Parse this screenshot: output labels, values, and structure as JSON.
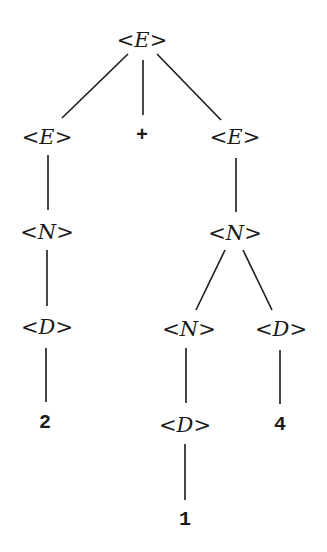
{
  "diagram": {
    "type": "parse-tree",
    "nodes": [
      {
        "id": "E0",
        "kind": "nonterminal",
        "label": "E",
        "x": 142,
        "y": 40
      },
      {
        "id": "E1",
        "kind": "nonterminal",
        "label": "E",
        "x": 47,
        "y": 137
      },
      {
        "id": "plus",
        "kind": "terminal",
        "label": "+",
        "x": 142,
        "y": 136
      },
      {
        "id": "E2",
        "kind": "nonterminal",
        "label": "E",
        "x": 235,
        "y": 137
      },
      {
        "id": "N1",
        "kind": "nonterminal",
        "label": "N",
        "x": 47,
        "y": 232
      },
      {
        "id": "N2",
        "kind": "nonterminal",
        "label": "N",
        "x": 235,
        "y": 233
      },
      {
        "id": "D1",
        "kind": "nonterminal",
        "label": "D",
        "x": 47,
        "y": 327
      },
      {
        "id": "N3",
        "kind": "nonterminal",
        "label": "N",
        "x": 189,
        "y": 329
      },
      {
        "id": "D3",
        "kind": "nonterminal",
        "label": "D",
        "x": 281,
        "y": 329
      },
      {
        "id": "t2",
        "kind": "terminal",
        "label": "2",
        "x": 45,
        "y": 423
      },
      {
        "id": "D2",
        "kind": "nonterminal",
        "label": "D",
        "x": 185,
        "y": 425
      },
      {
        "id": "t4",
        "kind": "terminal",
        "label": "4",
        "x": 280,
        "y": 425
      },
      {
        "id": "t1",
        "kind": "terminal",
        "label": "1",
        "x": 185,
        "y": 520
      }
    ],
    "edges": [
      {
        "from": "E0",
        "to": "E1",
        "x1": 128,
        "y1": 54,
        "x2": 62,
        "y2": 118
      },
      {
        "from": "E0",
        "to": "plus",
        "x1": 143,
        "y1": 60,
        "x2": 143,
        "y2": 115
      },
      {
        "from": "E0",
        "to": "E2",
        "x1": 157,
        "y1": 54,
        "x2": 221,
        "y2": 120
      },
      {
        "from": "E1",
        "to": "N1",
        "x1": 48,
        "y1": 155,
        "x2": 48,
        "y2": 210
      },
      {
        "from": "E2",
        "to": "N2",
        "x1": 236,
        "y1": 158,
        "x2": 236,
        "y2": 212
      },
      {
        "from": "N1",
        "to": "D1",
        "x1": 47,
        "y1": 250,
        "x2": 47,
        "y2": 306
      },
      {
        "from": "N2",
        "to": "N3",
        "x1": 225,
        "y1": 250,
        "x2": 196,
        "y2": 310
      },
      {
        "from": "N2",
        "to": "D3",
        "x1": 243,
        "y1": 250,
        "x2": 272,
        "y2": 310
      },
      {
        "from": "D1",
        "to": "t2",
        "x1": 46,
        "y1": 348,
        "x2": 46,
        "y2": 402
      },
      {
        "from": "N3",
        "to": "D2",
        "x1": 186,
        "y1": 348,
        "x2": 186,
        "y2": 403
      },
      {
        "from": "D3",
        "to": "t4",
        "x1": 280,
        "y1": 350,
        "x2": 280,
        "y2": 404
      },
      {
        "from": "D2",
        "to": "t1",
        "x1": 185,
        "y1": 444,
        "x2": 185,
        "y2": 500
      }
    ],
    "bracket_open": "<",
    "bracket_close": ">",
    "line_color": "#1a1a1a"
  }
}
